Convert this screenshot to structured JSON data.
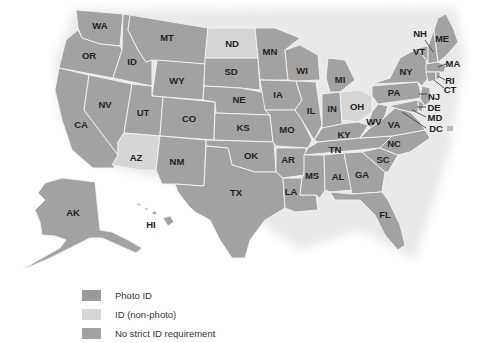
{
  "map": {
    "type": "choropleth",
    "colors": {
      "photo_id": "#9a9a9a",
      "non_photo": "#d6d6d6",
      "no_strict": "#a2a2a2",
      "border": "#f4f4f4",
      "label": "#222222"
    },
    "states": [
      {
        "code": "WA",
        "category": "no_strict"
      },
      {
        "code": "OR",
        "category": "no_strict"
      },
      {
        "code": "CA",
        "category": "no_strict"
      },
      {
        "code": "ID",
        "category": "no_strict"
      },
      {
        "code": "NV",
        "category": "no_strict"
      },
      {
        "code": "MT",
        "category": "no_strict"
      },
      {
        "code": "WY",
        "category": "no_strict"
      },
      {
        "code": "UT",
        "category": "no_strict"
      },
      {
        "code": "AZ",
        "category": "non_photo"
      },
      {
        "code": "CO",
        "category": "no_strict"
      },
      {
        "code": "NM",
        "category": "no_strict"
      },
      {
        "code": "ND",
        "category": "non_photo"
      },
      {
        "code": "SD",
        "category": "no_strict"
      },
      {
        "code": "NE",
        "category": "no_strict"
      },
      {
        "code": "KS",
        "category": "no_strict"
      },
      {
        "code": "OK",
        "category": "no_strict"
      },
      {
        "code": "TX",
        "category": "no_strict"
      },
      {
        "code": "MN",
        "category": "no_strict"
      },
      {
        "code": "IA",
        "category": "no_strict"
      },
      {
        "code": "MO",
        "category": "no_strict"
      },
      {
        "code": "AR",
        "category": "no_strict"
      },
      {
        "code": "LA",
        "category": "no_strict"
      },
      {
        "code": "WI",
        "category": "no_strict"
      },
      {
        "code": "IL",
        "category": "no_strict"
      },
      {
        "code": "MS",
        "category": "no_strict"
      },
      {
        "code": "MI",
        "category": "no_strict"
      },
      {
        "code": "IN",
        "category": "no_strict"
      },
      {
        "code": "KY",
        "category": "no_strict"
      },
      {
        "code": "TN",
        "category": "no_strict"
      },
      {
        "code": "AL",
        "category": "no_strict"
      },
      {
        "code": "OH",
        "category": "non_photo"
      },
      {
        "code": "WV",
        "category": "no_strict"
      },
      {
        "code": "VA",
        "category": "no_strict"
      },
      {
        "code": "NC",
        "category": "no_strict"
      },
      {
        "code": "SC",
        "category": "no_strict"
      },
      {
        "code": "GA",
        "category": "no_strict"
      },
      {
        "code": "FL",
        "category": "no_strict"
      },
      {
        "code": "PA",
        "category": "no_strict"
      },
      {
        "code": "NY",
        "category": "no_strict"
      },
      {
        "code": "VT",
        "category": "no_strict"
      },
      {
        "code": "NH",
        "category": "no_strict"
      },
      {
        "code": "ME",
        "category": "no_strict"
      },
      {
        "code": "MA",
        "category": "no_strict"
      },
      {
        "code": "RI",
        "category": "no_strict"
      },
      {
        "code": "CT",
        "category": "no_strict"
      },
      {
        "code": "NJ",
        "category": "no_strict"
      },
      {
        "code": "DE",
        "category": "no_strict"
      },
      {
        "code": "MD",
        "category": "no_strict"
      },
      {
        "code": "DC",
        "category": "no_strict"
      },
      {
        "code": "AK",
        "category": "no_strict"
      },
      {
        "code": "HI",
        "category": "no_strict"
      }
    ],
    "labels": {
      "WA": "WA",
      "OR": "OR",
      "CA": "CA",
      "ID": "ID",
      "NV": "NV",
      "MT": "MT",
      "WY": "WY",
      "UT": "UT",
      "AZ": "AZ",
      "CO": "CO",
      "NM": "NM",
      "ND": "ND",
      "SD": "SD",
      "NE": "NE",
      "KS": "KS",
      "OK": "OK",
      "TX": "TX",
      "MN": "MN",
      "IA": "IA",
      "MO": "MO",
      "AR": "AR",
      "LA": "LA",
      "WI": "WI",
      "IL": "IL",
      "MS": "MS",
      "MI": "MI",
      "IN": "IN",
      "KY": "KY",
      "TN": "TN",
      "AL": "AL",
      "OH": "OH",
      "WV": "WV",
      "VA": "VA",
      "NC": "NC",
      "SC": "SC",
      "GA": "GA",
      "FL": "FL",
      "PA": "PA",
      "NY": "NY",
      "VT": "VT",
      "NH": "NH",
      "ME": "ME",
      "MA": "MA",
      "RI": "RI",
      "CT": "CT",
      "NJ": "NJ",
      "DE": "DE",
      "MD": "MD",
      "DC": "DC",
      "AK": "AK",
      "HI": "HI"
    }
  },
  "legend": {
    "items": [
      {
        "label": "Photo ID",
        "color": "#9a9a9a"
      },
      {
        "label": "ID (non-photo)",
        "color": "#d6d6d6"
      },
      {
        "label": "No strict ID requirement",
        "color": "#a2a2a2"
      }
    ]
  }
}
